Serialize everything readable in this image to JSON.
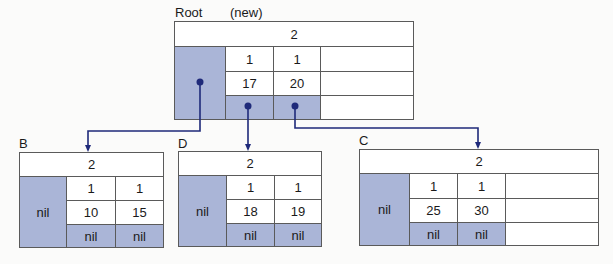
{
  "colors": {
    "pointer_fill": "#aab5d7",
    "wire": "#1f2a7a",
    "border": "#5a5a5a"
  },
  "root": {
    "label": "Root",
    "note": "(new)",
    "count": "2",
    "row1": [
      "1",
      "1"
    ],
    "row2": [
      "17",
      "20"
    ]
  },
  "nodes": {
    "B": {
      "label": "B",
      "count": "2",
      "left_ptr": "nil",
      "row1": [
        "1",
        "1"
      ],
      "row2": [
        "10",
        "15"
      ],
      "row3": [
        "nil",
        "nil"
      ]
    },
    "D": {
      "label": "D",
      "count": "2",
      "left_ptr": "nil",
      "row1": [
        "1",
        "1"
      ],
      "row2": [
        "18",
        "19"
      ],
      "row3": [
        "nil",
        "nil"
      ]
    },
    "C": {
      "label": "C",
      "count": "2",
      "left_ptr": "nil",
      "row1": [
        "1",
        "1"
      ],
      "row2": [
        "25",
        "30"
      ],
      "row3": [
        "nil",
        "nil"
      ]
    }
  },
  "edges": [
    {
      "from": "root.left_ptr",
      "to": "B"
    },
    {
      "from": "root.ptr1",
      "to": "D"
    },
    {
      "from": "root.ptr2",
      "to": "C"
    }
  ]
}
